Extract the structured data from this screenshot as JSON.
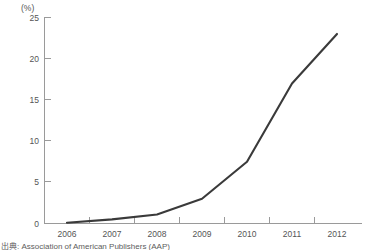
{
  "chart_data": {
    "type": "line",
    "title": "",
    "subtitle": "",
    "xlabel": "",
    "ylabel": "",
    "unit_label": "(%)",
    "categories": [
      "2006",
      "2007",
      "2008",
      "2009",
      "2010",
      "2011",
      "2012"
    ],
    "x": [
      2006,
      2007,
      2008,
      2009,
      2010,
      2011,
      2012
    ],
    "values": [
      0.1,
      0.5,
      1.1,
      3.0,
      7.5,
      17.0,
      23.0
    ],
    "series": [
      {
        "name": "",
        "values": [
          0.1,
          0.5,
          1.1,
          3.0,
          7.5,
          17.0,
          23.0
        ]
      }
    ],
    "ylim": [
      0,
      25
    ],
    "yticks": [
      0,
      5,
      10,
      15,
      20,
      25
    ],
    "ytick_labels": [
      "0",
      "5",
      "10",
      "15",
      "20",
      "25"
    ],
    "xtick_labels": [
      "2006",
      "2007",
      "2008",
      "2009",
      "2010",
      "2011",
      "2012"
    ],
    "grid": false,
    "legend": false,
    "legend_position": "none",
    "line_color": "#3a3a3a",
    "axis_color": "#9a9a9a",
    "text_color": "#555555"
  },
  "source": {
    "caption": "出典: Association of American Publishers (AAP)"
  }
}
